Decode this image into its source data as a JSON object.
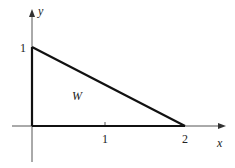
{
  "diagram": {
    "type": "region-plot",
    "axes": {
      "x_label": "x",
      "y_label": "y",
      "x_ticks": [
        "1",
        "2"
      ],
      "y_ticks": [
        "1"
      ]
    },
    "region": {
      "label": "W",
      "vertices": [
        [
          0,
          0
        ],
        [
          2,
          0
        ],
        [
          0,
          1
        ]
      ]
    }
  }
}
